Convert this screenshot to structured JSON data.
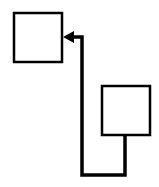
{
  "canvas": {
    "width": 159,
    "height": 187,
    "background": "#ffffff"
  },
  "colors": {
    "stroke": "#000000",
    "fill": "#ffffff"
  },
  "nodes": [
    {
      "id": "box-1",
      "x": 14,
      "y": 13,
      "width": 48,
      "height": 49
    },
    {
      "id": "box-2",
      "x": 102,
      "y": 86,
      "width": 48,
      "height": 49
    }
  ],
  "edges": [
    {
      "id": "connector",
      "from": "box-2",
      "to": "box-1",
      "points": "125,135 125,175 82,175 82,37 72,37",
      "arrow": "arrowhead-left"
    }
  ]
}
